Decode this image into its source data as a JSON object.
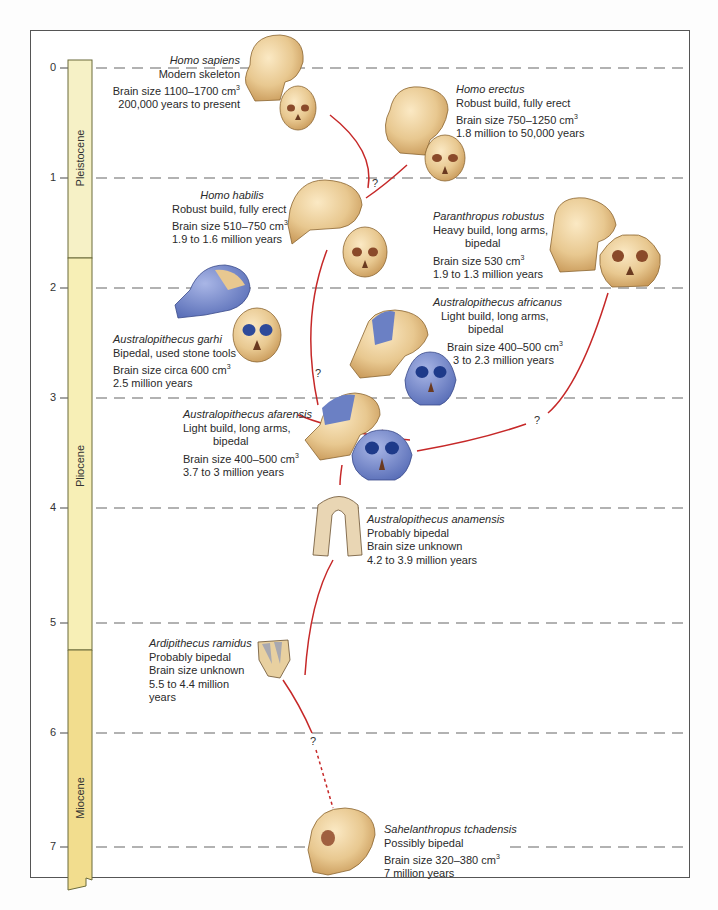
{
  "diagram": {
    "axis": {
      "title": "Millions of years ago",
      "ticks": [
        {
          "label": "0",
          "y": 68
        },
        {
          "label": "1",
          "y": 178
        },
        {
          "label": "2",
          "y": 288
        },
        {
          "label": "3",
          "y": 398
        },
        {
          "label": "4",
          "y": 508
        },
        {
          "label": "5",
          "y": 623
        },
        {
          "label": "6",
          "y": 733
        },
        {
          "label": "7",
          "y": 847
        }
      ]
    },
    "epochs": [
      {
        "name": "Pleistocene",
        "top": 60,
        "bottom": 258,
        "color": "#f6f1c6"
      },
      {
        "name": "Pliocene",
        "top": 258,
        "bottom": 650,
        "color": "#f7efb6"
      },
      {
        "name": "Miocene",
        "top": 650,
        "bottom": 885,
        "color": "#f2dd8e"
      }
    ],
    "colors": {
      "lineage": "#c62828",
      "bone": "#e8c890",
      "bone_shadow": "#c99a5a",
      "blue_region": "#6b80c4",
      "dash": "#666666",
      "frame": "#555555"
    },
    "species": [
      {
        "name": "Homo sapiens",
        "lines": [
          "Modern skeleton",
          "Brain size 1100–1700 cm",
          "200,000 years to present"
        ],
        "cube_line": 1
      },
      {
        "name": "Homo erectus",
        "lines": [
          "Robust build, fully erect",
          "Brain size 750–1250 cm",
          "1.8 million to 50,000 years"
        ],
        "cube_line": 1
      },
      {
        "name": "Homo habilis",
        "lines": [
          "Robust build, fully erect",
          "Brain size 510–750 cm",
          "1.9 to 1.6 million years"
        ],
        "cube_line": 1
      },
      {
        "name": "Paranthropus robustus",
        "lines": [
          "Heavy build, long arms,",
          "bipedal",
          "Brain size 530 cm",
          "1.9 to 1.3 million years"
        ],
        "cube_line": 2
      },
      {
        "name": "Australopithecus garhi",
        "lines": [
          "Bipedal, used stone tools",
          "Brain size circa 600 cm",
          "2.5 million years"
        ],
        "cube_line": 1
      },
      {
        "name": "Australopithecus africanus",
        "lines": [
          "Light build, long arms,",
          "bipedal",
          "Brain size 400–500 cm",
          "3 to 2.3 million years"
        ],
        "cube_line": 2
      },
      {
        "name": "Australopithecus afarensis",
        "lines": [
          "Light build, long arms,",
          "bipedal",
          "Brain size 400–500 cm",
          "3.7 to 3 million years"
        ],
        "cube_line": 2
      },
      {
        "name": "Australopithecus anamensis",
        "lines": [
          "Probably bipedal",
          "Brain size unknown",
          "4.2 to 3.9 million years"
        ],
        "cube_line": -1
      },
      {
        "name": "Ardipithecus ramidus",
        "lines": [
          "Probably bipedal",
          "Brain size unknown",
          "5.5 to 4.4 million years"
        ],
        "cube_line": -1
      },
      {
        "name": "Sahelanthropus tchadensis",
        "lines": [
          "Possibly bipedal",
          "Brain size 320–380 cm",
          "7 million years"
        ],
        "cube_line": 1
      }
    ],
    "superscript": "3",
    "question_mark": "?"
  }
}
